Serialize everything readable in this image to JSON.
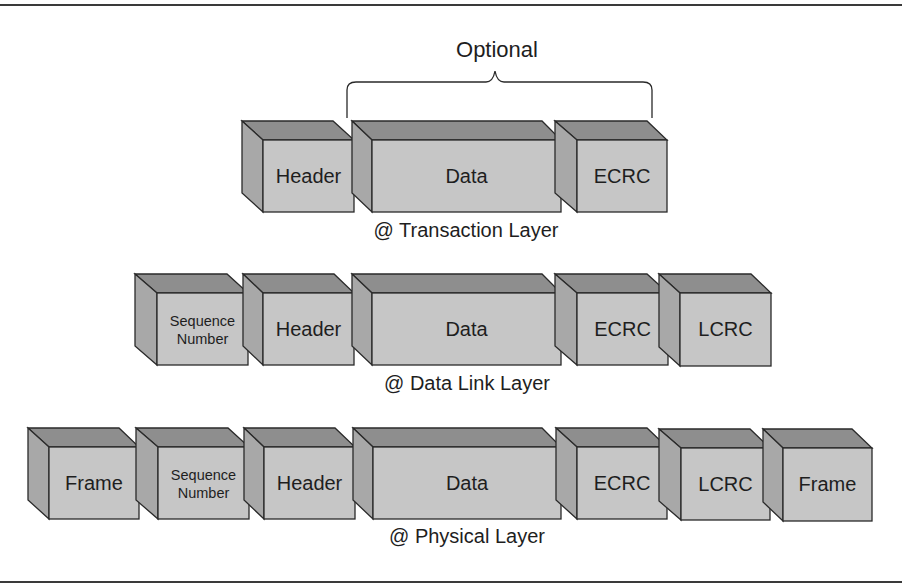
{
  "diagram": {
    "title": "",
    "optional_label": "Optional",
    "colors": {
      "front_face": "#c6c6c6",
      "top_face": "#8e8e8e",
      "side_face": "#a8a8a8",
      "edge": "#2a2a2a",
      "text": "#1e1e1e"
    },
    "layers": [
      {
        "label": "@ Transaction Layer",
        "boxes": [
          {
            "label": "Header"
          },
          {
            "label": "Data"
          },
          {
            "label": "ECRC"
          }
        ]
      },
      {
        "label": "@ Data Link Layer",
        "boxes": [
          {
            "label_line1": "Sequence",
            "label_line2": "Number"
          },
          {
            "label": "Header"
          },
          {
            "label": "Data"
          },
          {
            "label": "ECRC"
          },
          {
            "label": "LCRC"
          }
        ]
      },
      {
        "label": "@ Physical Layer",
        "boxes": [
          {
            "label": "Frame"
          },
          {
            "label_line1": "Sequence",
            "label_line2": "Number"
          },
          {
            "label": "Header"
          },
          {
            "label": "Data"
          },
          {
            "label": "ECRC"
          },
          {
            "label": "LCRC"
          },
          {
            "label": "Frame"
          }
        ]
      }
    ]
  }
}
